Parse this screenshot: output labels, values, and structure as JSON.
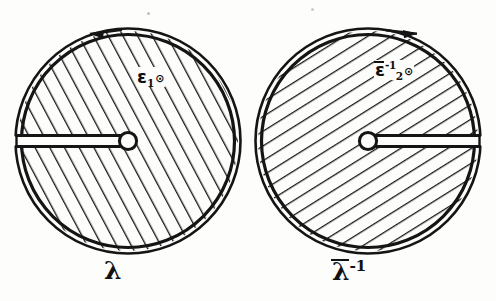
{
  "figure": {
    "kind": "two-hatched-discs",
    "background_color": "#fdfdfc",
    "ink_color": "#121212",
    "discs": [
      {
        "id": "left",
        "caption": "λ",
        "caption_plain": "lambda",
        "interior_label_base": "ε",
        "interior_label_sub": "1",
        "interior_label_sup": "",
        "interior_label_overbar": false,
        "interior_label_marker": "⊙",
        "interior_label_plain": "ε₁⊙",
        "center_x": 128,
        "center_y": 141,
        "radius": 112,
        "hatch_direction": "descending",
        "hatch_angle_deg": -28,
        "hatch_spacing_px": 12,
        "slit_side": "left",
        "slit_from": "boundary",
        "slit_to": "center",
        "hub_radius": 9,
        "orientation": "counterclockwise",
        "arrow_position": "top",
        "arrow_points": "left"
      },
      {
        "id": "right",
        "caption": "λ⁻¹",
        "caption_base": "λ",
        "caption_sup": "-1",
        "caption_overbar": true,
        "caption_plain": "lambda-bar inverse",
        "interior_label_base": "ε",
        "interior_label_sub": "2",
        "interior_label_sup": "-1",
        "interior_label_overbar": true,
        "interior_label_marker": "⊙",
        "interior_label_plain": "ε̄₂⁻¹⊙",
        "center_x": 368,
        "center_y": 141,
        "radius": 112,
        "hatch_direction": "ascending",
        "hatch_angle_deg": 58,
        "hatch_spacing_px": 12,
        "slit_side": "right",
        "slit_from": "center",
        "slit_to": "boundary",
        "hub_radius": 9,
        "orientation": "clockwise",
        "arrow_position": "top",
        "arrow_points": "right"
      }
    ]
  },
  "captions": {
    "left": "λ",
    "right_base": "λ",
    "right_sup": "-1"
  },
  "labels": {
    "left_base": "ε",
    "left_sub": "1",
    "left_marker": "⊙",
    "right_base": "ε",
    "right_sub": "2",
    "right_sup": "-1",
    "right_marker": "⊙"
  }
}
